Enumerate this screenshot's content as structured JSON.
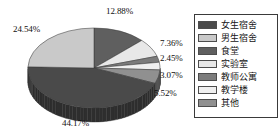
{
  "chart_data": {
    "type": "pie",
    "title": "",
    "subtitle": "",
    "xlabel": "",
    "ylabel": "",
    "legend_position": "right",
    "grid": false,
    "three_d": true,
    "categories": [
      "女生宿舍",
      "男生宿舍",
      "食堂",
      "实验室",
      "教师公寓",
      "教学楼",
      "其他"
    ],
    "values": [
      44.17,
      24.54,
      12.88,
      7.36,
      2.45,
      3.07,
      5.52
    ],
    "value_unit": "%",
    "slice_labels": [
      "44.17%",
      "24.54%",
      "12.88%",
      "7.36%",
      "2.45%",
      "3.07%",
      "5.52%"
    ],
    "colors": [
      "#4a4a4a",
      "#c9c9c9",
      "#5f5f5f",
      "#e8e8e8",
      "#7c7c7c",
      "#f0f0f0",
      "#909090"
    ],
    "slices": [
      {
        "label": "女生宿舍",
        "value": 44.17,
        "display": "44.17%",
        "color": "#4a4a4a"
      },
      {
        "label": "男生宿舍",
        "value": 24.54,
        "display": "24.54%",
        "color": "#c9c9c9"
      },
      {
        "label": "食堂",
        "value": 12.88,
        "display": "12.88%",
        "color": "#5f5f5f"
      },
      {
        "label": "实验室",
        "value": 7.36,
        "display": "7.36%",
        "color": "#e8e8e8"
      },
      {
        "label": "教师公寓",
        "value": 2.45,
        "display": "2.45%",
        "color": "#7c7c7c"
      },
      {
        "label": "教学楼",
        "value": 3.07,
        "display": "3.07%",
        "color": "#f0f0f0"
      },
      {
        "label": "其他",
        "value": 5.52,
        "display": "5.52%",
        "color": "#909090"
      }
    ]
  },
  "labels": {
    "top": "12.88%",
    "upper_left": "24.54%",
    "right_1": "7.36%",
    "right_2": "2.45%",
    "right_3": "3.07%",
    "right_4": "5.52%",
    "bottom": "44.17%"
  },
  "legend": {
    "items": [
      {
        "label": "女生宿舍",
        "color": "#4a4a4a"
      },
      {
        "label": "男生宿舍",
        "color": "#c9c9c9"
      },
      {
        "label": "食堂",
        "color": "#5f5f5f"
      },
      {
        "label": "实验室",
        "color": "#e8e8e8"
      },
      {
        "label": "教师公寓",
        "color": "#7c7c7c"
      },
      {
        "label": "教学楼",
        "color": "#f0f0f0"
      },
      {
        "label": "其他",
        "color": "#909090"
      }
    ]
  }
}
